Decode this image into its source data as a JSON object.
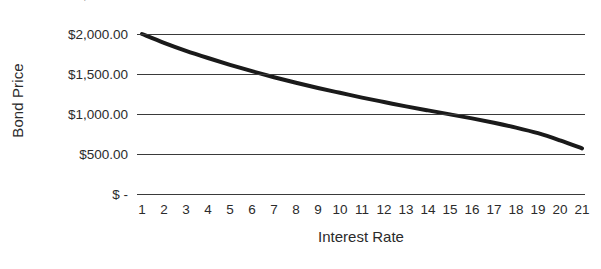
{
  "chart_data": {
    "type": "line",
    "title": "",
    "xlabel": "Interest Rate",
    "ylabel": "Bond Price",
    "x": [
      1,
      2,
      3,
      4,
      5,
      6,
      7,
      8,
      9,
      10,
      11,
      12,
      13,
      14,
      15,
      16,
      17,
      18,
      19,
      20,
      21
    ],
    "values": [
      2000,
      1890,
      1790,
      1700,
      1615,
      1535,
      1460,
      1390,
      1325,
      1265,
      1205,
      1150,
      1095,
      1045,
      995,
      945,
      890,
      830,
      760,
      670,
      570
    ],
    "series": [
      {
        "name": "Bond Price",
        "values": [
          2000,
          1890,
          1790,
          1700,
          1615,
          1535,
          1460,
          1390,
          1325,
          1265,
          1205,
          1150,
          1095,
          1045,
          995,
          945,
          890,
          830,
          760,
          670,
          570
        ],
        "color": "#1a1a1a",
        "line_width": 4
      }
    ],
    "xlim": [
      1,
      21
    ],
    "ylim": [
      0,
      2500
    ],
    "x_tick_labels": [
      "1",
      "2",
      "3",
      "4",
      "5",
      "6",
      "7",
      "8",
      "9",
      "10",
      "11",
      "12",
      "13",
      "14",
      "15",
      "16",
      "17",
      "18",
      "19",
      "20",
      "21"
    ],
    "y_ticks": [
      2500,
      2000,
      1500,
      1000,
      500,
      0
    ],
    "y_tick_labels": [
      "$2,500.00",
      "$2,000.00",
      "$1,500.00",
      "$1,000.00",
      "$500.00",
      "$ -"
    ],
    "grid": {
      "horizontal": true,
      "vertical": false,
      "color": "#3a3a3a"
    },
    "legend": {
      "visible": false,
      "position": "none"
    },
    "background_color": "#ffffff",
    "text_color": "#2b2b2b"
  }
}
